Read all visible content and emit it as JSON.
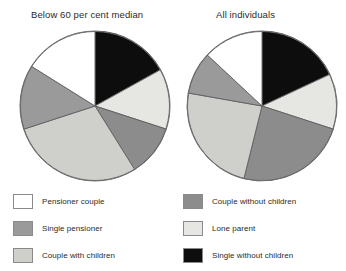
{
  "charts": [
    {
      "title": "Below 60 per cent median",
      "center": {
        "x": 76,
        "y": 76
      },
      "radius": 75
    },
    {
      "title": "All individuals",
      "center": {
        "x": 76,
        "y": 76
      },
      "radius": 75
    }
  ],
  "legend": {
    "columns": [
      {
        "items": [
          {
            "label": "Pensioner couple",
            "color": "#ffffff",
            "key": "pensioner-couple"
          },
          {
            "label": "Single pensioner",
            "color": "#9a9a9a",
            "key": "single-pensioner"
          },
          {
            "label": "Couple with children",
            "color": "#cfcfcb",
            "key": "couple-with-children"
          }
        ]
      },
      {
        "items": [
          {
            "label": "Couple without children",
            "color": "#8c8c8c",
            "key": "couple-without-children"
          },
          {
            "label": "Lone parent",
            "color": "#e6e6e2",
            "key": "lone-parent"
          },
          {
            "label": "Single without children",
            "color": "#0d0d0d",
            "key": "single-without-children"
          }
        ]
      }
    ]
  },
  "chart_data": {
    "type": "pie",
    "categories": [
      "Single without children",
      "Lone parent",
      "Couple without children",
      "Couple with children",
      "Single pensioner",
      "Pensioner couple"
    ],
    "colors": [
      "#0d0d0d",
      "#e6e6e2",
      "#8c8c8c",
      "#cfcfcb",
      "#9a9a9a",
      "#ffffff"
    ],
    "start_angle_deg": 0,
    "direction": "clockwise",
    "legend": "below",
    "grid": false,
    "series": [
      {
        "name": "Below 60 per cent median",
        "values": [
          17,
          13,
          11,
          29,
          14,
          16
        ],
        "units": "per cent",
        "slice_angles_deg": [
          61,
          47,
          40,
          104,
          50,
          58
        ]
      },
      {
        "name": "All individuals",
        "values": [
          18,
          12,
          24,
          24,
          9,
          13
        ],
        "units": "per cent",
        "slice_angles_deg": [
          65,
          43,
          86,
          86,
          33,
          47
        ]
      }
    ]
  }
}
